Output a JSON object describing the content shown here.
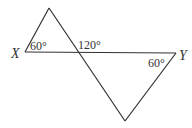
{
  "diagram": {
    "type": "geometry",
    "points": {
      "top_apex": [
        49,
        8
      ],
      "X": [
        25,
        52
      ],
      "intersection": [
        77,
        52
      ],
      "Y": [
        176,
        53
      ],
      "bottom_apex": [
        125,
        121
      ]
    },
    "labels": {
      "X": "X",
      "Y": "Y",
      "angle_X": "60°",
      "angle_intersection": "120°",
      "angle_Y": "60°"
    },
    "line_color": "#333333"
  }
}
